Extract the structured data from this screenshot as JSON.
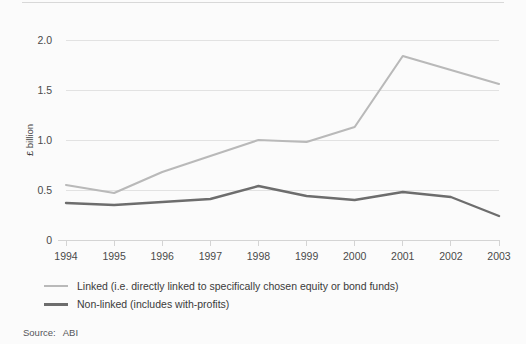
{
  "source": {
    "label": "Source:",
    "value": "ABI"
  },
  "legend": {
    "position": "below-axis",
    "items": [
      {
        "name": "linked",
        "label": "Linked (i.e. directly linked to specifically chosen equity or bond funds)",
        "color": "#b9b9b9"
      },
      {
        "name": "nonlinked",
        "label": "Non-linked (includes with-profits)",
        "color": "#6d6d6d"
      }
    ]
  },
  "chart_data": {
    "type": "line",
    "title": "",
    "subtitle": "",
    "xlabel": "",
    "ylabel": "£ billion",
    "x": [
      "1994",
      "1995",
      "1996",
      "1997",
      "1998",
      "1999",
      "2000",
      "2001",
      "2002",
      "2003"
    ],
    "categories": [
      "1994",
      "1995",
      "1996",
      "1997",
      "1998",
      "1999",
      "2000",
      "2001",
      "2002",
      "2003"
    ],
    "ylim": [
      0,
      2.0
    ],
    "yticks": [
      0,
      0.5,
      1.0,
      1.5,
      2.0
    ],
    "ytick_labels": [
      "0",
      "0.5",
      "1.0",
      "1.5",
      "2.0"
    ],
    "grid": true,
    "grid_axis": "y",
    "legend_position": "bottom-left",
    "series": [
      {
        "name": "Linked (i.e. directly linked to specifically chosen equity or bond funds)",
        "short_name": "Linked",
        "color": "#b9b9b9",
        "values": [
          0.55,
          0.47,
          0.68,
          0.84,
          1.0,
          0.98,
          1.13,
          1.84,
          1.7,
          1.56
        ]
      },
      {
        "name": "Non-linked (includes with-profits)",
        "short_name": "Non-linked",
        "color": "#6d6d6d",
        "values": [
          0.37,
          0.35,
          0.38,
          0.41,
          0.54,
          0.44,
          0.4,
          0.48,
          0.43,
          0.24
        ]
      }
    ]
  }
}
